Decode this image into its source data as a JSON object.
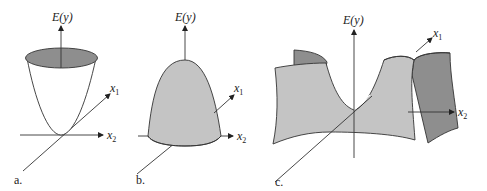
{
  "figure": {
    "panels": [
      {
        "id": "a",
        "label": "a.",
        "surface": "upward paraboloid (minimum)",
        "axes": {
          "vertical": "E(y)",
          "x1": "x",
          "x1_sub": "1",
          "x2": "x",
          "x2_sub": "2"
        }
      },
      {
        "id": "b",
        "label": "b.",
        "surface": "downward paraboloid (maximum)",
        "axes": {
          "vertical": "E(y)",
          "x1": "x",
          "x1_sub": "1",
          "x2": "x",
          "x2_sub": "2"
        }
      },
      {
        "id": "c",
        "label": "c.",
        "surface": "saddle surface",
        "axes": {
          "vertical": "E(y)",
          "x1": "x",
          "x1_sub": "1",
          "x2": "x",
          "x2_sub": "2"
        }
      }
    ],
    "colors": {
      "light_fill": "#c4c4c4",
      "dark_fill": "#8e8e8e",
      "line": "#333333",
      "background": "#ffffff"
    }
  }
}
